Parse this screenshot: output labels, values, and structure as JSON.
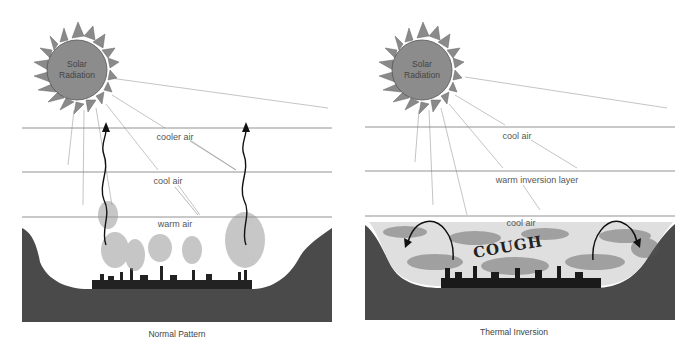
{
  "diagrams": [
    {
      "id": "normal",
      "caption": "Normal Pattern",
      "sun_label_line1": "Solar",
      "sun_label_line2": "Radiation",
      "layers": [
        "cooler air",
        "cool air",
        "warm air"
      ],
      "arrows": "two wavy arrows rising upward from city through all layers"
    },
    {
      "id": "inversion",
      "caption": "Thermal Inversion",
      "sun_label_line1": "Solar",
      "sun_label_line2": "Radiation",
      "layers": [
        "cool air",
        "warm inversion layer",
        "cool air"
      ],
      "smog_text": "COUGH",
      "arrows": "two curved arrows turning back down under inversion layer"
    }
  ],
  "colors": {
    "sun": "#8a8a8a",
    "ground": "#4a4a4a",
    "line": "#777777",
    "ray": "#aaaaaa"
  }
}
